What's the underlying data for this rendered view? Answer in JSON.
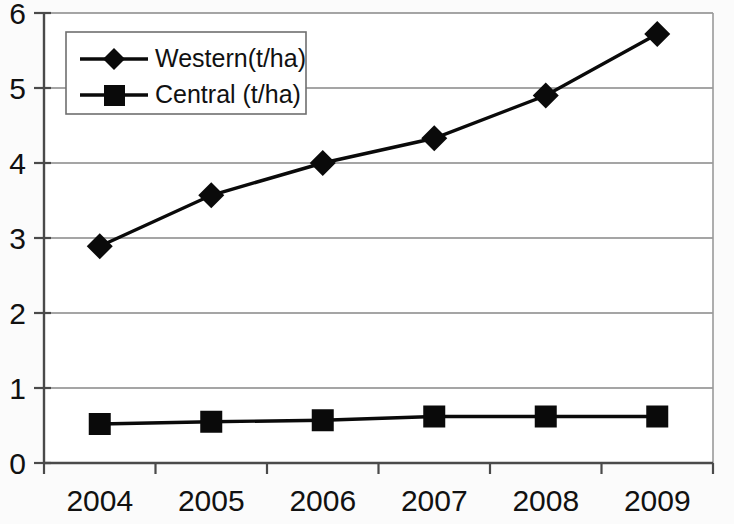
{
  "chart_data": {
    "type": "line",
    "title": "",
    "subtitle": "",
    "xlabel": "",
    "ylabel": "",
    "categories": [
      "2004",
      "2005",
      "2006",
      "2007",
      "2008",
      "2009"
    ],
    "series": [
      {
        "name": "Western(t/ha)",
        "marker": "diamond",
        "color": "#0a0a0a",
        "values": [
          2.89,
          3.57,
          4.0,
          4.33,
          4.9,
          5.72
        ]
      },
      {
        "name": "Central (t/ha)",
        "marker": "square",
        "color": "#0a0a0a",
        "values": [
          0.52,
          0.55,
          0.57,
          0.62,
          0.62,
          0.62
        ]
      }
    ],
    "ylim": [
      0,
      6
    ],
    "y_ticks": [
      0,
      1,
      2,
      3,
      4,
      5,
      6
    ],
    "y_tick_labels": [
      "0",
      "1",
      "2",
      "3",
      "4",
      "5",
      "6"
    ],
    "x_tick_labels": [
      "2004",
      "2005",
      "2006",
      "2007",
      "2008",
      "2009"
    ],
    "grid": true,
    "grid_axis": "y",
    "legend_position": "top-left",
    "legend_entries": [
      "Western(t/ha)",
      "Central (t/ha)"
    ]
  },
  "axes": {
    "y_labels": [
      "6",
      "5",
      "4",
      "3",
      "2",
      "1",
      "0"
    ],
    "x_labels": [
      "2004",
      "2005",
      "2006",
      "2007",
      "2008",
      "2009"
    ]
  },
  "legend": {
    "entry_1": "Western(t/ha)",
    "entry_2": "Central (t/ha)"
  },
  "colors": {
    "series": "#0a0a0a",
    "gridline": "#878787",
    "axis": "#4a4a4a",
    "background": "#fbfbfb"
  }
}
